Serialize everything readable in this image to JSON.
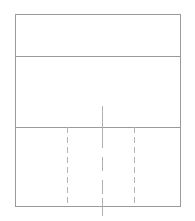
{
  "figure": {
    "canvas": {
      "width": 195,
      "height": 221,
      "background": "#ffffff"
    },
    "colors": {
      "outline": "#9a9a9a",
      "divider": "#9a9a9a",
      "dashed": "#b4b4b4",
      "center": "#b0b0b0",
      "fill": "#ffffff"
    },
    "stroke_widths": {
      "outline": 1,
      "divider": 1,
      "dashed": 1.4,
      "center": 1.4
    },
    "outline": {
      "label": "outer-rectangle",
      "x": 15,
      "y": 14,
      "width": 165,
      "height": 192
    },
    "bands": [
      {
        "label": "top-band",
        "y_top": 14,
        "y_bottom": 56,
        "height": 42
      },
      {
        "label": "middle-band",
        "y_top": 56,
        "y_bottom": 127,
        "height": 71
      },
      {
        "label": "bottom-band",
        "y_top": 127,
        "y_bottom": 206,
        "height": 79
      }
    ],
    "horizontal_dividers": [
      {
        "label": "divider-1",
        "y": 56,
        "x_start": 15,
        "x_end": 180
      },
      {
        "label": "divider-2",
        "y": 127,
        "x_start": 15,
        "x_end": 180
      }
    ],
    "vertical_dashed_lines": [
      {
        "label": "dashed-left",
        "x": 67,
        "y_start": 127,
        "y_end": 206,
        "dash": "6 4"
      },
      {
        "label": "dashed-right",
        "x": 134,
        "y_start": 127,
        "y_end": 206,
        "dash": "6 4"
      }
    ],
    "center_line": {
      "label": "center-line",
      "x": 102,
      "y_start": 106,
      "y_end": 216,
      "segments": [
        {
          "label": "center-solid-upper",
          "y_start": 106,
          "y_end": 134,
          "dash": "none"
        },
        {
          "label": "center-dashed-middle",
          "y_start": 134,
          "y_end": 198,
          "dash": "14 9"
        },
        {
          "label": "center-solid-lower",
          "y_start": 198,
          "y_end": 216,
          "dash": "none"
        }
      ]
    }
  }
}
